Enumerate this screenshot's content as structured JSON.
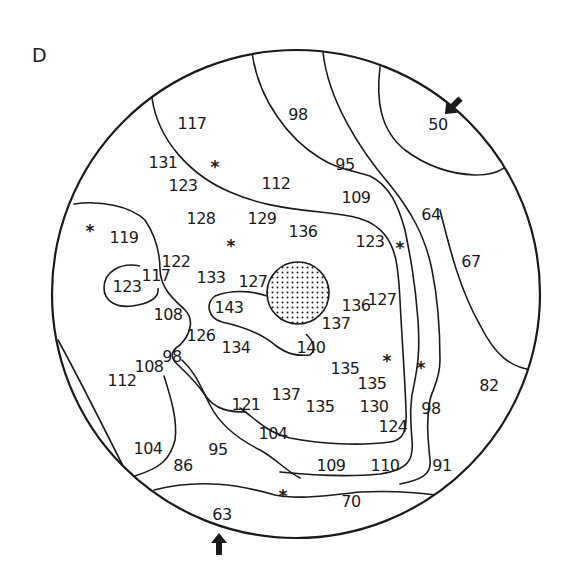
{
  "panel": {
    "letter": "D"
  },
  "colors": {
    "ink": "#1a1a1a",
    "background": "#ffffff",
    "blind_spot_fill": "#ffffff"
  },
  "field": {
    "shape": "circle",
    "center": [
      296,
      294
    ],
    "radius": 244
  },
  "blind_spot": {
    "center": [
      298,
      293
    ],
    "radius": 31,
    "pattern": "dotted"
  },
  "values": [
    {
      "text": "117",
      "x": 192,
      "y": 124
    },
    {
      "text": "98",
      "x": 298,
      "y": 115
    },
    {
      "text": "50",
      "x": 438,
      "y": 125
    },
    {
      "text": "131",
      "x": 163,
      "y": 163
    },
    {
      "text": "95",
      "x": 345,
      "y": 165
    },
    {
      "text": "123",
      "x": 183,
      "y": 186
    },
    {
      "text": "112",
      "x": 276,
      "y": 184
    },
    {
      "text": "109",
      "x": 356,
      "y": 198
    },
    {
      "text": "64",
      "x": 431,
      "y": 215
    },
    {
      "text": "128",
      "x": 201,
      "y": 219
    },
    {
      "text": "129",
      "x": 262,
      "y": 219
    },
    {
      "text": "136",
      "x": 303,
      "y": 232
    },
    {
      "text": "119",
      "x": 124,
      "y": 238
    },
    {
      "text": "123",
      "x": 370,
      "y": 242
    },
    {
      "text": "67",
      "x": 471,
      "y": 262
    },
    {
      "text": "122",
      "x": 176,
      "y": 262
    },
    {
      "text": "117",
      "x": 156,
      "y": 276
    },
    {
      "text": "133",
      "x": 211,
      "y": 278
    },
    {
      "text": "127",
      "x": 253,
      "y": 282
    },
    {
      "text": "123",
      "x": 127,
      "y": 287
    },
    {
      "text": "143",
      "x": 229,
      "y": 308
    },
    {
      "text": "136",
      "x": 356,
      "y": 306
    },
    {
      "text": "127",
      "x": 382,
      "y": 300
    },
    {
      "text": "108",
      "x": 168,
      "y": 315
    },
    {
      "text": "137",
      "x": 336,
      "y": 324
    },
    {
      "text": "126",
      "x": 201,
      "y": 336
    },
    {
      "text": "134",
      "x": 236,
      "y": 348
    },
    {
      "text": "140",
      "x": 311,
      "y": 348
    },
    {
      "text": "98",
      "x": 172,
      "y": 357
    },
    {
      "text": "108",
      "x": 149,
      "y": 367
    },
    {
      "text": "135",
      "x": 345,
      "y": 369
    },
    {
      "text": "112",
      "x": 122,
      "y": 381
    },
    {
      "text": "135",
      "x": 372,
      "y": 384
    },
    {
      "text": "82",
      "x": 489,
      "y": 386
    },
    {
      "text": "137",
      "x": 286,
      "y": 395
    },
    {
      "text": "121",
      "x": 246,
      "y": 405
    },
    {
      "text": "135",
      "x": 320,
      "y": 407
    },
    {
      "text": "130",
      "x": 374,
      "y": 407
    },
    {
      "text": "98",
      "x": 431,
      "y": 409
    },
    {
      "text": "124",
      "x": 393,
      "y": 427
    },
    {
      "text": "104",
      "x": 273,
      "y": 434
    },
    {
      "text": "104",
      "x": 148,
      "y": 449
    },
    {
      "text": "95",
      "x": 218,
      "y": 450
    },
    {
      "text": "86",
      "x": 183,
      "y": 466
    },
    {
      "text": "109",
      "x": 331,
      "y": 466
    },
    {
      "text": "110",
      "x": 385,
      "y": 466
    },
    {
      "text": "91",
      "x": 442,
      "y": 466
    },
    {
      "text": "70",
      "x": 351,
      "y": 502
    },
    {
      "text": "63",
      "x": 222,
      "y": 515
    }
  ],
  "markers": [
    {
      "symbol": "*",
      "x": 215,
      "y": 166
    },
    {
      "symbol": "*",
      "x": 90,
      "y": 230
    },
    {
      "symbol": "*",
      "x": 231,
      "y": 245
    },
    {
      "symbol": "*",
      "x": 400,
      "y": 247
    },
    {
      "symbol": "*",
      "x": 387,
      "y": 360
    },
    {
      "symbol": "*",
      "x": 421,
      "y": 367
    },
    {
      "symbol": "*",
      "x": 283,
      "y": 495
    }
  ],
  "arrows": [
    {
      "name": "arrow-upper-right",
      "x": 452,
      "y": 107,
      "direction": "down-left"
    },
    {
      "name": "arrow-bottom",
      "x": 219,
      "y": 541,
      "direction": "up"
    }
  ]
}
